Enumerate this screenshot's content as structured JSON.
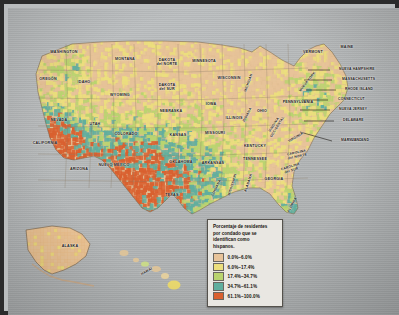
{
  "map": {
    "title_implied": "Porcentaje de residentes por condado que se identifican como hispanos",
    "insets": [
      {
        "name": "ALASKA"
      },
      {
        "name": "HAWÁI"
      }
    ]
  },
  "legend": {
    "title_line1": "Porcentaje de residentes",
    "title_line2": "por condado que se",
    "title_line3": "identifican como",
    "title_line4": "hispanos.",
    "entries": [
      {
        "label": "0.0%–6.0%",
        "color": "#e8c49a"
      },
      {
        "label": "6.0%–17.4%",
        "color": "#ecdf7d"
      },
      {
        "label": "17.4%–34.7%",
        "color": "#b9d46f"
      },
      {
        "label": "34.7%–61.1%",
        "color": "#5fae9e"
      },
      {
        "label": "61.1%–100.0%",
        "color": "#d9602f"
      }
    ]
  },
  "state_labels": [
    {
      "name": "WASHINGTON",
      "x": 56,
      "y": 45,
      "size": "s"
    },
    {
      "name": "OREGÓN",
      "x": 40,
      "y": 72,
      "size": "s"
    },
    {
      "name": "IDAHO",
      "x": 76,
      "y": 75,
      "size": "s"
    },
    {
      "name": "MONTANA",
      "x": 117,
      "y": 52,
      "size": "s"
    },
    {
      "name": "WYOMING",
      "x": 112,
      "y": 88,
      "size": "s"
    },
    {
      "name": "NEVADA",
      "x": 51,
      "y": 113,
      "size": "s"
    },
    {
      "name": "UTAH",
      "x": 87,
      "y": 117,
      "size": "s"
    },
    {
      "name": "CALIFORNIA",
      "x": 37,
      "y": 136,
      "size": "s"
    },
    {
      "name": "ARIZONA",
      "x": 71,
      "y": 162,
      "size": "s"
    },
    {
      "name": "COLORADO",
      "x": 118,
      "y": 127,
      "size": "s"
    },
    {
      "name": "NUEVO MÉXICO",
      "x": 106,
      "y": 158,
      "size": "s"
    },
    {
      "name": "DAKOTA\ndel NORTE",
      "x": 159,
      "y": 55,
      "size": "s"
    },
    {
      "name": "DAKOTA\ndel SUR",
      "x": 159,
      "y": 80,
      "size": "s"
    },
    {
      "name": "NEBRASKA",
      "x": 163,
      "y": 104,
      "size": "s"
    },
    {
      "name": "KANSAS",
      "x": 170,
      "y": 128,
      "size": "s"
    },
    {
      "name": "OKLAHOMA",
      "x": 173,
      "y": 155,
      "size": "s"
    },
    {
      "name": "TEXAS",
      "x": 164,
      "y": 188,
      "size": "s"
    },
    {
      "name": "MINNESOTA",
      "x": 196,
      "y": 54,
      "size": "s"
    },
    {
      "name": "IOWA",
      "x": 203,
      "y": 97,
      "size": "s"
    },
    {
      "name": "MISSOURI",
      "x": 207,
      "y": 126,
      "size": "s"
    },
    {
      "name": "ARKANSAS",
      "x": 205,
      "y": 156,
      "size": "s"
    },
    {
      "name": "WISCONSIN",
      "x": 221,
      "y": 71,
      "size": "s"
    },
    {
      "name": "ILLINOIS",
      "x": 226,
      "y": 111,
      "size": "s"
    },
    {
      "name": "KENTUCKY",
      "x": 247,
      "y": 139,
      "size": "s"
    },
    {
      "name": "TENNESSEE",
      "x": 247,
      "y": 152,
      "size": "s"
    },
    {
      "name": "OHIO",
      "x": 254,
      "y": 104,
      "size": "s"
    },
    {
      "name": "GEORGIA",
      "x": 266,
      "y": 172,
      "size": "s"
    },
    {
      "name": "VERMONT",
      "x": 305,
      "y": 45,
      "size": "s"
    },
    {
      "name": "MAINE",
      "x": 339,
      "y": 40,
      "size": "s"
    },
    {
      "name": "PENNSYLVANIA",
      "x": 290,
      "y": 95,
      "size": "s"
    },
    {
      "name": "MARYLAND",
      "x": 350,
      "y": 133,
      "size": "s"
    }
  ],
  "rotated_labels": [
    {
      "name": "INDIANA",
      "x": 240,
      "y": 107,
      "rot": -62
    },
    {
      "name": "VIRGINIA\nOCCIDENTAL",
      "x": 268,
      "y": 118,
      "rot": -58
    },
    {
      "name": "VIRGINIA",
      "x": 288,
      "y": 130,
      "rot": -30
    },
    {
      "name": "CAROLINA\ndel NORTE",
      "x": 289,
      "y": 147,
      "rot": -12
    },
    {
      "name": "CAROLINA\ndel SUR",
      "x": 283,
      "y": 161,
      "rot": -18
    },
    {
      "name": "LUISIANA",
      "x": 209,
      "y": 180,
      "rot": -64
    },
    {
      "name": "MISSISSIPPI",
      "x": 225,
      "y": 177,
      "rot": -72
    },
    {
      "name": "ALABAMA",
      "x": 241,
      "y": 175,
      "rot": -72
    },
    {
      "name": "FLORIDA",
      "x": 285,
      "y": 197,
      "rot": -62
    },
    {
      "name": "NUEVA YORK",
      "x": 300,
      "y": 74,
      "rot": -52
    },
    {
      "name": "MICHIGAN",
      "x": 241,
      "y": 75,
      "rot": -70
    },
    {
      "name": "HAWÁI",
      "x": 139,
      "y": 264,
      "rot": -30
    }
  ],
  "callout_labels": [
    {
      "name": "NUEVA HAMPSHIRE",
      "x": 331,
      "y": 62
    },
    {
      "name": "MASSACHUSETTS",
      "x": 334,
      "y": 72
    },
    {
      "name": "RHODE ISLAND",
      "x": 337,
      "y": 82
    },
    {
      "name": "CONNECTICUT",
      "x": 330,
      "y": 92
    },
    {
      "name": "NUEVA JERSEY",
      "x": 331,
      "y": 102
    },
    {
      "name": "DELAWARE",
      "x": 335,
      "y": 113
    },
    {
      "name": "MARYLAND",
      "x": 333,
      "y": 133
    },
    {
      "name": "NUEVA YORK",
      "x": 309,
      "y": 55
    }
  ],
  "inset_labels": [
    {
      "name": "ALASKA",
      "x": 62,
      "y": 239
    }
  ]
}
